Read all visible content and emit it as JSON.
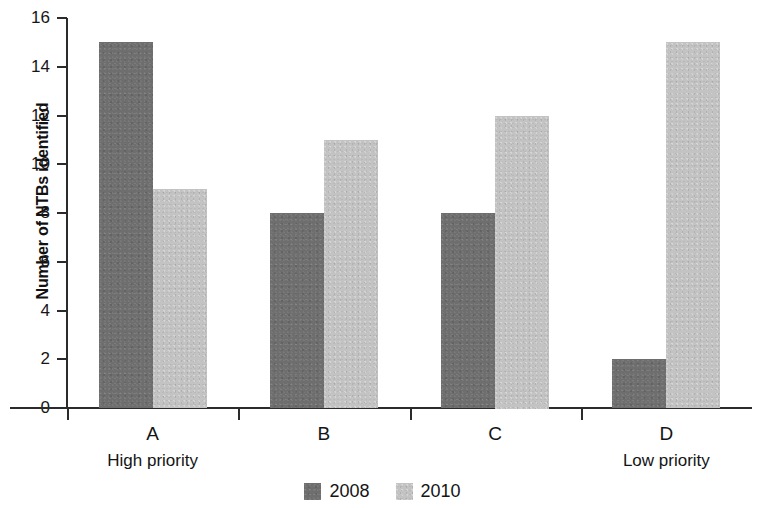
{
  "chart_data": {
    "type": "bar",
    "title": "",
    "xlabel": "",
    "ylabel": "Number of NTBs identified",
    "categories": [
      "A",
      "B",
      "C",
      "D"
    ],
    "category_notes": {
      "A": "High priority",
      "D": "Low priority"
    },
    "series": [
      {
        "name": "2008",
        "color": "#6e6e6e",
        "values": [
          15,
          8,
          8,
          2
        ]
      },
      {
        "name": "2010",
        "color": "#c3c3c3",
        "values": [
          9,
          11,
          12,
          15
        ]
      }
    ],
    "ylim": [
      0,
      16
    ],
    "ytick_labels": [
      "16",
      "14",
      "12",
      "10",
      "8",
      "6",
      "4",
      "2",
      "0"
    ],
    "ytick_values": [
      16,
      14,
      12,
      10,
      8,
      6,
      4,
      2,
      0
    ],
    "grid": false,
    "legend_position": "bottom-center"
  },
  "axis": {
    "y_title": "Number of NTBs identified"
  },
  "legend": {
    "items": [
      {
        "label": "2008"
      },
      {
        "label": "2010"
      }
    ]
  }
}
